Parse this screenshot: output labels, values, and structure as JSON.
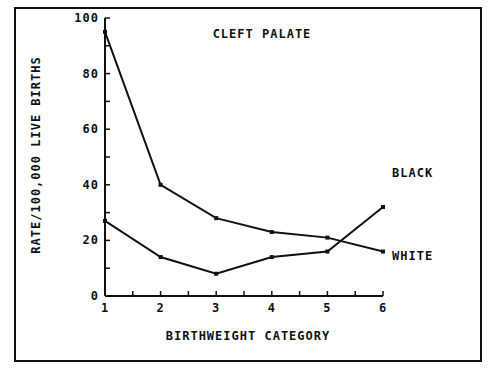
{
  "chart_data": {
    "type": "line",
    "title": "CLEFT PALATE",
    "xlabel": "BIRTHWEIGHT CATEGORY",
    "ylabel": "RATE/100,000 LIVE BIRTHS",
    "x": [
      1,
      2,
      3,
      4,
      5,
      6
    ],
    "xticks": [
      "1",
      "2",
      "3",
      "4",
      "5",
      "6"
    ],
    "yticks": [
      "0",
      "20",
      "40",
      "60",
      "80",
      "100"
    ],
    "ylim": [
      0,
      100
    ],
    "xlim": [
      1,
      6
    ],
    "grid": false,
    "series": [
      {
        "name": "WHITE",
        "values": [
          95,
          40,
          28,
          23,
          21,
          16
        ],
        "label_position": "end-below"
      },
      {
        "name": "BLACK",
        "values": [
          27,
          14,
          8,
          14,
          16,
          32
        ],
        "label_position": "end-above"
      }
    ]
  }
}
